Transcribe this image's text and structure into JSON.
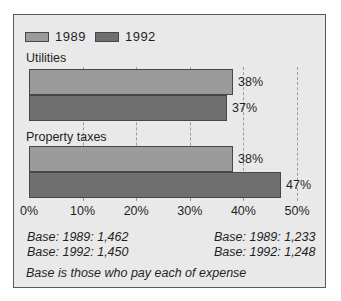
{
  "chart_data": {
    "type": "bar",
    "orientation": "horizontal",
    "categories": [
      "Utilities",
      "Property taxes"
    ],
    "series": [
      {
        "name": "1989",
        "color": "#9b9b9b",
        "values": [
          38,
          38
        ]
      },
      {
        "name": "1992",
        "color": "#6f6f6f",
        "values": [
          37,
          47
        ]
      }
    ],
    "value_labels": [
      [
        "38%",
        "37%"
      ],
      [
        "38%",
        "47%"
      ]
    ],
    "xlim": [
      0,
      50
    ],
    "x_ticks": [
      0,
      10,
      20,
      30,
      40,
      50
    ],
    "x_tick_labels": [
      "0%",
      "10%",
      "20%",
      "30%",
      "40%",
      "50%"
    ],
    "gridline_ticks": [
      10,
      20,
      30,
      40,
      50
    ],
    "grid": "dashed-vertical",
    "legend_position": "top-left"
  },
  "annotations": {
    "base_left": [
      "Base: 1989: 1,462",
      "Base: 1992: 1,450"
    ],
    "base_right": [
      "Base: 1989: 1,233",
      "Base: 1992: 1,248"
    ],
    "footnote": "Base is those who pay each of expense"
  },
  "colors": {
    "page_bg": "#ffffff",
    "panel_bg": "#e9e9e9",
    "panel_border": "#5a5a5a",
    "bar_border": "#474747",
    "gridline": "#9c9c9c",
    "text": "#1f1f1f"
  }
}
